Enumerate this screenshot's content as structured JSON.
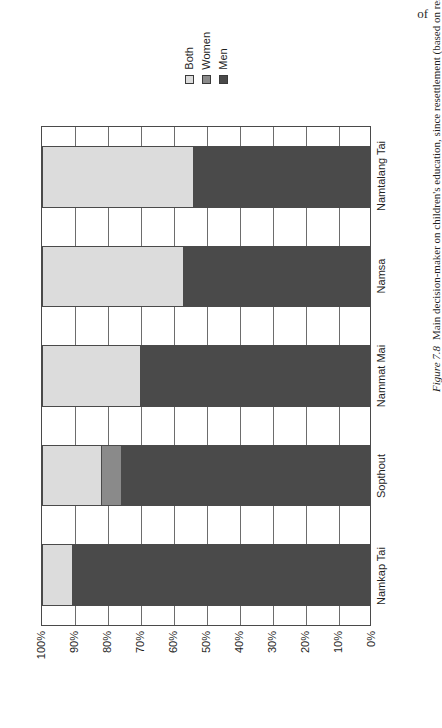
{
  "page": {
    "running_fragment": "of"
  },
  "figure": {
    "number_label": "Figure 7.8",
    "caption": "Main decision-maker on children's education, since resettlement (based on responses from men)."
  },
  "legend": {
    "items": [
      {
        "label": "Both",
        "color": "#dcdcdc"
      },
      {
        "label": "Women",
        "color": "#8a8a8a"
      },
      {
        "label": "Men",
        "color": "#4a4a4a"
      }
    ]
  },
  "axis": {
    "tick_labels": [
      "100%",
      "90%",
      "80%",
      "70%",
      "60%",
      "50%",
      "40%",
      "30%",
      "20%",
      "10%",
      "0%"
    ]
  },
  "chart_data": {
    "type": "bar",
    "orientation": "horizontal-stacked-rotated",
    "title": "",
    "xlabel": "",
    "ylabel": "",
    "ylim": [
      0,
      100
    ],
    "grid": true,
    "legend_position": "top",
    "stacked": true,
    "categories": [
      "Namkap Tai",
      "Sopthout",
      "Nammat Mai",
      "Namsa",
      "Namtalang Tai"
    ],
    "series": [
      {
        "name": "Men",
        "color": "#4a4a4a",
        "values": [
          91,
          76,
          70,
          57,
          54
        ]
      },
      {
        "name": "Women",
        "color": "#8a8a8a",
        "values": [
          0,
          6,
          0,
          0,
          0
        ]
      },
      {
        "name": "Both",
        "color": "#dcdcdc",
        "values": [
          9,
          18,
          30,
          43,
          46
        ]
      }
    ]
  }
}
